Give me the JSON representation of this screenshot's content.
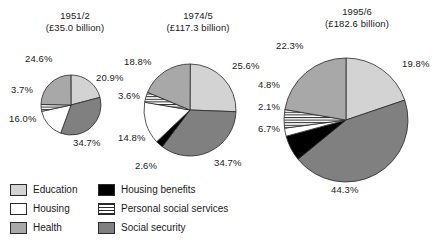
{
  "chart_data": {
    "type": "pie",
    "legend_position": "bottom-left",
    "categories": [
      "Education",
      "Housing",
      "Health",
      "Housing benefits",
      "Personal social services",
      "Social security"
    ],
    "colors": {
      "Education": "#d3d3d3",
      "Housing": "#ffffff",
      "Health": "#a8a8a8",
      "Housing benefits": "#000000",
      "Personal social services": "#ffffff",
      "Social security": "#808080"
    },
    "charts": [
      {
        "title_line1": "1951/2",
        "title_line2": "(£35.0 billion)",
        "total": 35.0,
        "currency": "£",
        "unit": "billion",
        "radius_px": 30,
        "slices": [
          {
            "label": "Education",
            "value": 20.9,
            "display": "20.9%"
          },
          {
            "label": "Social security",
            "value": 34.7,
            "display": "34.7%"
          },
          {
            "label": "Housing",
            "value": 16.0,
            "display": "16.0%"
          },
          {
            "label": "Personal social services",
            "value": 3.7,
            "display": "3.7%"
          },
          {
            "label": "Health",
            "value": 24.6,
            "display": "24.6%"
          }
        ]
      },
      {
        "title_line1": "1974/5",
        "title_line2": "(£117.3 billion)",
        "total": 117.3,
        "currency": "£",
        "unit": "billion",
        "radius_px": 46,
        "slices": [
          {
            "label": "Education",
            "value": 25.6,
            "display": "25.6%"
          },
          {
            "label": "Social security",
            "value": 34.7,
            "display": "34.7%"
          },
          {
            "label": "Housing benefits",
            "value": 2.6,
            "display": "2.6%"
          },
          {
            "label": "Housing",
            "value": 14.8,
            "display": "14.8%"
          },
          {
            "label": "Personal social services",
            "value": 3.6,
            "display": "3.6%"
          },
          {
            "label": "Health",
            "value": 18.8,
            "display": "18.8%"
          }
        ]
      },
      {
        "title_line1": "1995/6",
        "title_line2": "(£182.6 billion)",
        "total": 182.6,
        "currency": "£",
        "unit": "billion",
        "radius_px": 62,
        "slices": [
          {
            "label": "Education",
            "value": 19.8,
            "display": "19.8%"
          },
          {
            "label": "Social security",
            "value": 44.3,
            "display": "44.3%"
          },
          {
            "label": "Housing benefits",
            "value": 6.7,
            "display": "6.7%"
          },
          {
            "label": "Housing",
            "value": 2.1,
            "display": "2.1%"
          },
          {
            "label": "Personal social services",
            "value": 4.8,
            "display": "4.8%"
          },
          {
            "label": "Health",
            "value": 22.3,
            "display": "22.3%"
          }
        ]
      }
    ]
  },
  "legend": {
    "rows": [
      {
        "left": {
          "label": "Education",
          "swatch": "education-swatch"
        },
        "right": {
          "label": "Housing benefits",
          "swatch": "housing-benefits-swatch"
        }
      },
      {
        "left": {
          "label": "Housing",
          "swatch": "housing-swatch"
        },
        "right": {
          "label": "Personal social services",
          "swatch": "personal-social-services-swatch"
        }
      },
      {
        "left": {
          "label": "Health",
          "swatch": "health-swatch"
        },
        "right": {
          "label": "Social security",
          "swatch": "social-security-swatch"
        }
      }
    ]
  }
}
